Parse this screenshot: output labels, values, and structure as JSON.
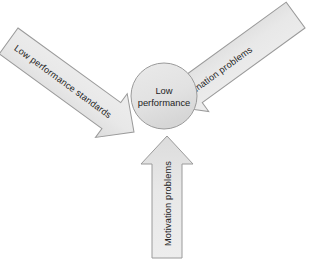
{
  "diagram": {
    "type": "converging-arrows",
    "background_color": "#ffffff",
    "shape_fill_color": "#e7e7e7",
    "shape_fill_color_dark": "#d8d8d8",
    "shape_stroke_color": "#9a9a9a",
    "text_color": "#242424",
    "hub": {
      "label_line1": "Low",
      "label_line2": "performance",
      "shape": "circle"
    },
    "arrows": [
      {
        "id": "low-performance-standards",
        "label": "Low performance standards",
        "direction": "down-right",
        "rotation_deg": 36,
        "origin": "top-left"
      },
      {
        "id": "coordination-problems",
        "label": "Coordination problems",
        "direction": "down-left",
        "rotation_deg": -36,
        "origin": "top-right"
      },
      {
        "id": "motivation-problems",
        "label": "Motivation problems",
        "direction": "up",
        "rotation_deg": -90,
        "origin": "bottom-center"
      }
    ]
  }
}
